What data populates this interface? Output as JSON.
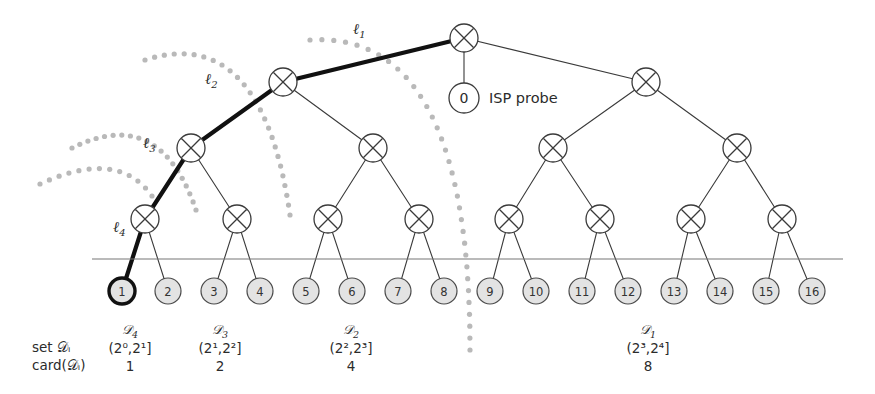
{
  "figure": {
    "colors": {
      "stroke": "#3a3a3a",
      "highlight": "#111111",
      "leaf_fill": "#e3e3e3",
      "leaf_stroke": "#4a4a4a",
      "dotted_arc": "#b9b9b9",
      "baseline": "#777777",
      "text": "#2b2b2b"
    },
    "geometry": {
      "leaf_x_start": 122,
      "leaf_x_step": 46.0,
      "leaf_y": 291,
      "leaf_r": 13,
      "node_r": 14,
      "level_y": [
        38,
        82,
        148,
        219
      ],
      "baseline_y": 259,
      "baseline_x1": 92,
      "baseline_x2": 843
    }
  },
  "root": {
    "name": "root-node",
    "x": 464,
    "y": 38
  },
  "probe": {
    "name": "isp-probe-node",
    "value": "0",
    "label": "ISP probe",
    "x": 464,
    "y": 98,
    "r": 15,
    "label_x": 489,
    "label_y": 103
  },
  "level_labels": [
    {
      "id": "l1",
      "text": "ℓ",
      "sub": "1",
      "x": 353,
      "y": 34
    },
    {
      "id": "l2",
      "text": "ℓ",
      "sub": "2",
      "x": 205,
      "y": 84
    },
    {
      "id": "l3",
      "text": "ℓ",
      "sub": "3",
      "x": 143,
      "y": 148
    },
    {
      "id": "l4",
      "text": "ℓ",
      "sub": "4",
      "x": 113,
      "y": 232
    }
  ],
  "internal_nodes": [
    {
      "name": "node-L2-left",
      "x": 283,
      "y": 82,
      "level": 2
    },
    {
      "name": "node-L2-right",
      "x": 646,
      "y": 82,
      "level": 2
    },
    {
      "name": "node-L3-a",
      "x": 191,
      "y": 148,
      "level": 3
    },
    {
      "name": "node-L3-b",
      "x": 373,
      "y": 148,
      "level": 3
    },
    {
      "name": "node-L3-c",
      "x": 553,
      "y": 148,
      "level": 3
    },
    {
      "name": "node-L3-d",
      "x": 737,
      "y": 148,
      "level": 3
    },
    {
      "name": "node-L4-a",
      "x": 145,
      "y": 219,
      "level": 4
    },
    {
      "name": "node-L4-b",
      "x": 237,
      "y": 219,
      "level": 4
    },
    {
      "name": "node-L4-c",
      "x": 328,
      "y": 219,
      "level": 4
    },
    {
      "name": "node-L4-d",
      "x": 419,
      "y": 219,
      "level": 4
    },
    {
      "name": "node-L4-e",
      "x": 509,
      "y": 219,
      "level": 4
    },
    {
      "name": "node-L4-f",
      "x": 600,
      "y": 219,
      "level": 4
    },
    {
      "name": "node-L4-g",
      "x": 691,
      "y": 219,
      "level": 4
    },
    {
      "name": "node-L4-h",
      "x": 782,
      "y": 219,
      "level": 4
    }
  ],
  "edges": [
    {
      "from": [
        464,
        38
      ],
      "to": [
        283,
        82
      ],
      "highlight": true
    },
    {
      "from": [
        464,
        38
      ],
      "to": [
        646,
        82
      ],
      "highlight": false
    },
    {
      "from": [
        464,
        38
      ],
      "to": [
        464,
        98
      ],
      "highlight": false
    },
    {
      "from": [
        283,
        82
      ],
      "to": [
        191,
        148
      ],
      "highlight": true
    },
    {
      "from": [
        283,
        82
      ],
      "to": [
        373,
        148
      ],
      "highlight": false
    },
    {
      "from": [
        646,
        82
      ],
      "to": [
        553,
        148
      ],
      "highlight": false
    },
    {
      "from": [
        646,
        82
      ],
      "to": [
        737,
        148
      ],
      "highlight": false
    },
    {
      "from": [
        191,
        148
      ],
      "to": [
        145,
        219
      ],
      "highlight": true
    },
    {
      "from": [
        191,
        148
      ],
      "to": [
        237,
        219
      ],
      "highlight": false
    },
    {
      "from": [
        373,
        148
      ],
      "to": [
        328,
        219
      ],
      "highlight": false
    },
    {
      "from": [
        373,
        148
      ],
      "to": [
        419,
        219
      ],
      "highlight": false
    },
    {
      "from": [
        553,
        148
      ],
      "to": [
        509,
        219
      ],
      "highlight": false
    },
    {
      "from": [
        553,
        148
      ],
      "to": [
        600,
        219
      ],
      "highlight": false
    },
    {
      "from": [
        737,
        148
      ],
      "to": [
        691,
        219
      ],
      "highlight": false
    },
    {
      "from": [
        737,
        148
      ],
      "to": [
        782,
        219
      ],
      "highlight": false
    },
    {
      "from": [
        145,
        219
      ],
      "to": [
        122,
        291
      ],
      "highlight": true
    },
    {
      "from": [
        145,
        219
      ],
      "to": [
        168,
        291
      ],
      "highlight": false
    },
    {
      "from": [
        237,
        219
      ],
      "to": [
        214,
        291
      ],
      "highlight": false
    },
    {
      "from": [
        237,
        219
      ],
      "to": [
        260,
        291
      ],
      "highlight": false
    },
    {
      "from": [
        328,
        219
      ],
      "to": [
        306,
        291
      ],
      "highlight": false
    },
    {
      "from": [
        328,
        219
      ],
      "to": [
        352,
        291
      ],
      "highlight": false
    },
    {
      "from": [
        419,
        219
      ],
      "to": [
        398,
        291
      ],
      "highlight": false
    },
    {
      "from": [
        419,
        219
      ],
      "to": [
        444,
        291
      ],
      "highlight": false
    },
    {
      "from": [
        509,
        219
      ],
      "to": [
        490,
        291
      ],
      "highlight": false
    },
    {
      "from": [
        509,
        219
      ],
      "to": [
        536,
        291
      ],
      "highlight": false
    },
    {
      "from": [
        600,
        219
      ],
      "to": [
        582,
        291
      ],
      "highlight": false
    },
    {
      "from": [
        600,
        219
      ],
      "to": [
        628,
        291
      ],
      "highlight": false
    },
    {
      "from": [
        691,
        219
      ],
      "to": [
        674,
        291
      ],
      "highlight": false
    },
    {
      "from": [
        691,
        219
      ],
      "to": [
        720,
        291
      ],
      "highlight": false
    },
    {
      "from": [
        782,
        219
      ],
      "to": [
        766,
        291
      ],
      "highlight": false
    },
    {
      "from": [
        782,
        219
      ],
      "to": [
        812,
        291
      ],
      "highlight": false
    }
  ],
  "leaves": [
    {
      "label": "1",
      "x": 122,
      "highlighted": true
    },
    {
      "label": "2",
      "x": 168,
      "highlighted": false
    },
    {
      "label": "3",
      "x": 214,
      "highlighted": false
    },
    {
      "label": "4",
      "x": 260,
      "highlighted": false
    },
    {
      "label": "5",
      "x": 306,
      "highlighted": false
    },
    {
      "label": "6",
      "x": 352,
      "highlighted": false
    },
    {
      "label": "7",
      "x": 398,
      "highlighted": false
    },
    {
      "label": "8",
      "x": 444,
      "highlighted": false
    },
    {
      "label": "9",
      "x": 490,
      "highlighted": false
    },
    {
      "label": "10",
      "x": 536,
      "highlighted": false
    },
    {
      "label": "11",
      "x": 582,
      "highlighted": false
    },
    {
      "label": "12",
      "x": 628,
      "highlighted": false
    },
    {
      "label": "13",
      "x": 674,
      "highlighted": false
    },
    {
      "label": "14",
      "x": 720,
      "highlighted": false
    },
    {
      "label": "15",
      "x": 766,
      "highlighted": false
    },
    {
      "label": "16",
      "x": 812,
      "highlighted": false
    }
  ],
  "arcs": [
    {
      "name": "arc-l3-boundary",
      "path": "M 40,184 Q 118,148 152,196",
      "points": 13
    },
    {
      "name": "arc-l2-boundary",
      "path": "M 72,148 Q 160,104 196,210",
      "points": 20
    },
    {
      "name": "arc-l1-boundary",
      "path": "M 145,60 Q 262,22 290,215",
      "points": 26
    },
    {
      "name": "arc-root-boundary",
      "path": "M 310,40 Q 470,30 470,350",
      "points": 34
    }
  ],
  "row_labels": {
    "set_label": "set 𝒟ᵢ",
    "card_label": "card(𝒟ᵢ)",
    "set_label_x": 32,
    "card_label_x": 32,
    "set_y": 352,
    "card_y": 370
  },
  "groups": [
    {
      "name": "group-D4",
      "d_label": "𝒟",
      "d_sub": "4",
      "interval_base": "2",
      "interval": "(2⁰,2¹]",
      "card": "1",
      "x": 130,
      "d_y": 334,
      "interval_y": 353,
      "card_y": 371
    },
    {
      "name": "group-D3",
      "d_label": "𝒟",
      "d_sub": "3",
      "interval": "(2¹,2²]",
      "card": "2",
      "x": 220,
      "d_y": 334,
      "interval_y": 353,
      "card_y": 371
    },
    {
      "name": "group-D2",
      "d_label": "𝒟",
      "d_sub": "2",
      "interval": "(2²,2³]",
      "card": "4",
      "x": 351,
      "d_y": 334,
      "interval_y": 353,
      "card_y": 371
    },
    {
      "name": "group-D1",
      "d_label": "𝒟",
      "d_sub": "1",
      "interval": "(2³,2⁴]",
      "card": "8",
      "x": 648,
      "d_y": 334,
      "interval_y": 353,
      "card_y": 371
    }
  ]
}
